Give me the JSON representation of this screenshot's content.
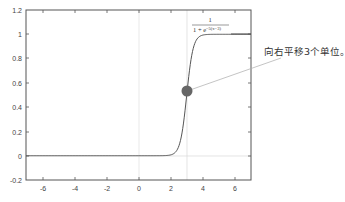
{
  "chart_data": {
    "type": "line",
    "title": "",
    "xlabel": "",
    "ylabel": "",
    "xlim": [
      -7,
      7
    ],
    "ylim": [
      -0.2,
      1.2
    ],
    "x_ticks": [
      -6,
      -4,
      -2,
      0,
      2,
      4,
      6
    ],
    "y_ticks": [
      1.2,
      1,
      0.8,
      0.6,
      0.4,
      0.2,
      0,
      -0.2
    ],
    "grid": false,
    "reference_lines": [
      {
        "type": "vertical",
        "x": 0
      },
      {
        "type": "vertical",
        "x": 3
      },
      {
        "type": "horizontal",
        "y": 0
      }
    ],
    "series": [
      {
        "name": "1/(1+e^(-5(x-3)))",
        "function": "1 / (1 + exp(-5*(x-3)))",
        "x": [
          -7,
          -6,
          -5,
          -4,
          -3,
          -2,
          -1,
          0,
          1,
          2,
          2.5,
          3,
          3.5,
          4,
          5,
          6,
          7
        ],
        "values": [
          0,
          0,
          0,
          0,
          0,
          0,
          0,
          0,
          0,
          0.007,
          0.076,
          0.5,
          0.924,
          0.993,
          1,
          1,
          1
        ]
      }
    ],
    "highlight_point": {
      "x": 3,
      "y": 0.5
    },
    "legend": {
      "numerator": "1",
      "denominator": "1 + e",
      "exponent": "−5(x−3)",
      "position": "top-right"
    },
    "annotation": "向右平移3个单位。"
  },
  "colors": {
    "axis": "#555555",
    "curve": "#555555",
    "refline": "#d8d8d8",
    "point": "#666666",
    "pointer_line": "#aaaaaa"
  }
}
